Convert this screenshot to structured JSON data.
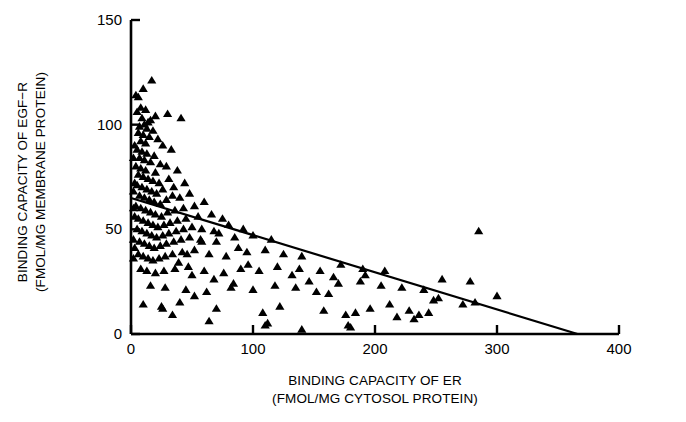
{
  "chart_data": {
    "type": "scatter",
    "title": "",
    "xlabel": "BINDING CAPACITY OF ER",
    "xlabel_line2": "(FMOL/MG CYTOSOL PROTEIN)",
    "ylabel": "BINDING CAPACITY OF EGF−R",
    "ylabel_line2": "(FMOL/MG MEMBRANE PROTEIN)",
    "xlim": [
      0,
      400
    ],
    "ylim": [
      0,
      150
    ],
    "xticks": [
      0,
      100,
      200,
      300,
      400
    ],
    "yticks": [
      0,
      50,
      100,
      150
    ],
    "xticklabels": [
      "0",
      "100",
      "200",
      "300",
      "400"
    ],
    "yticklabels": [
      "0",
      "50",
      "100",
      "150"
    ],
    "grid": false,
    "legend": null,
    "marker": "triangle-up",
    "marker_color": "#000000",
    "series": [
      {
        "name": "patients",
        "marker": "triangle-up",
        "points": [
          [
            4,
            114
          ],
          [
            6,
            113
          ],
          [
            10,
            117
          ],
          [
            17,
            121
          ],
          [
            8,
            108
          ],
          [
            12,
            107
          ],
          [
            5,
            106
          ],
          [
            20,
            104
          ],
          [
            9,
            103
          ],
          [
            14,
            101
          ],
          [
            16,
            102
          ],
          [
            7,
            99
          ],
          [
            11,
            100
          ],
          [
            13,
            98
          ],
          [
            18,
            97
          ],
          [
            30,
            105
          ],
          [
            41,
            103
          ],
          [
            6,
            96
          ],
          [
            10,
            95
          ],
          [
            15,
            94
          ],
          [
            22,
            93
          ],
          [
            8,
            92
          ],
          [
            12,
            91
          ],
          [
            26,
            90
          ],
          [
            5,
            88
          ],
          [
            9,
            87
          ],
          [
            13,
            86
          ],
          [
            19,
            85
          ],
          [
            33,
            88
          ],
          [
            7,
            84
          ],
          [
            11,
            83
          ],
          [
            16,
            82
          ],
          [
            24,
            81
          ],
          [
            4,
            80
          ],
          [
            8,
            79
          ],
          [
            12,
            78
          ],
          [
            20,
            77
          ],
          [
            29,
            80
          ],
          [
            38,
            78
          ],
          [
            6,
            76
          ],
          [
            10,
            75
          ],
          [
            14,
            74
          ],
          [
            18,
            73
          ],
          [
            23,
            72
          ],
          [
            31,
            74
          ],
          [
            5,
            71
          ],
          [
            9,
            70
          ],
          [
            13,
            69
          ],
          [
            17,
            68
          ],
          [
            21,
            67
          ],
          [
            26,
            69
          ],
          [
            35,
            70
          ],
          [
            44,
            72
          ],
          [
            7,
            66
          ],
          [
            11,
            65
          ],
          [
            15,
            64
          ],
          [
            19,
            63
          ],
          [
            24,
            62
          ],
          [
            29,
            64
          ],
          [
            34,
            66
          ],
          [
            40,
            65
          ],
          [
            48,
            67
          ],
          [
            4,
            61
          ],
          [
            8,
            60
          ],
          [
            12,
            59
          ],
          [
            16,
            58
          ],
          [
            20,
            57
          ],
          [
            25,
            56
          ],
          [
            30,
            58
          ],
          [
            36,
            59
          ],
          [
            43,
            60
          ],
          [
            52,
            61
          ],
          [
            60,
            63
          ],
          [
            6,
            55
          ],
          [
            10,
            54
          ],
          [
            14,
            53
          ],
          [
            18,
            52
          ],
          [
            22,
            51
          ],
          [
            27,
            52
          ],
          [
            32,
            53
          ],
          [
            38,
            54
          ],
          [
            45,
            55
          ],
          [
            55,
            56
          ],
          [
            66,
            57
          ],
          [
            75,
            55
          ],
          [
            5,
            50
          ],
          [
            9,
            49
          ],
          [
            13,
            48
          ],
          [
            17,
            47
          ],
          [
            21,
            46
          ],
          [
            26,
            47
          ],
          [
            31,
            48
          ],
          [
            37,
            49
          ],
          [
            43,
            50
          ],
          [
            50,
            51
          ],
          [
            58,
            50
          ],
          [
            68,
            49
          ],
          [
            80,
            52
          ],
          [
            92,
            50
          ],
          [
            7,
            44
          ],
          [
            11,
            43
          ],
          [
            15,
            42
          ],
          [
            19,
            41
          ],
          [
            24,
            42
          ],
          [
            29,
            43
          ],
          [
            35,
            44
          ],
          [
            41,
            45
          ],
          [
            48,
            46
          ],
          [
            57,
            45
          ],
          [
            70,
            44
          ],
          [
            85,
            46
          ],
          [
            100,
            47
          ],
          [
            115,
            45
          ],
          [
            6,
            38
          ],
          [
            10,
            37
          ],
          [
            14,
            36
          ],
          [
            18,
            35
          ],
          [
            23,
            36
          ],
          [
            28,
            37
          ],
          [
            34,
            38
          ],
          [
            42,
            39
          ],
          [
            52,
            40
          ],
          [
            64,
            38
          ],
          [
            78,
            37
          ],
          [
            95,
            39
          ],
          [
            110,
            40
          ],
          [
            125,
            38
          ],
          [
            140,
            37
          ],
          [
            8,
            31
          ],
          [
            13,
            30
          ],
          [
            20,
            29
          ],
          [
            27,
            30
          ],
          [
            36,
            31
          ],
          [
            47,
            32
          ],
          [
            60,
            30
          ],
          [
            76,
            29
          ],
          [
            90,
            31
          ],
          [
            105,
            30
          ],
          [
            120,
            32
          ],
          [
            138,
            31
          ],
          [
            155,
            30
          ],
          [
            172,
            33
          ],
          [
            190,
            31
          ],
          [
            16,
            23
          ],
          [
            28,
            22
          ],
          [
            45,
            21
          ],
          [
            62,
            20
          ],
          [
            82,
            22
          ],
          [
            100,
            21
          ],
          [
            118,
            23
          ],
          [
            135,
            22
          ],
          [
            152,
            20
          ],
          [
            170,
            24
          ],
          [
            188,
            25
          ],
          [
            205,
            23
          ],
          [
            222,
            22
          ],
          [
            240,
            21
          ],
          [
            255,
            26
          ],
          [
            278,
            25
          ],
          [
            300,
            18
          ],
          [
            10,
            14
          ],
          [
            25,
            13
          ],
          [
            40,
            15
          ],
          [
            70,
            12
          ],
          [
            108,
            10
          ],
          [
            122,
            13
          ],
          [
            140,
            2
          ],
          [
            158,
            11
          ],
          [
            176,
            9
          ],
          [
            180,
            3
          ],
          [
            196,
            12
          ],
          [
            212,
            14
          ],
          [
            228,
            11
          ],
          [
            236,
            9
          ],
          [
            248,
            16
          ],
          [
            252,
            17
          ],
          [
            272,
            14
          ],
          [
            282,
            15
          ],
          [
            52,
            18
          ],
          [
            64,
            6
          ],
          [
            34,
            9
          ],
          [
            26,
            12
          ],
          [
            110,
            4
          ],
          [
            112,
            5
          ],
          [
            178,
            4
          ],
          [
            184,
            10
          ],
          [
            218,
            8
          ],
          [
            232,
            7
          ],
          [
            244,
            10
          ],
          [
            285,
            49
          ],
          [
            2,
            68
          ],
          [
            3,
            72
          ],
          [
            2,
            60
          ],
          [
            3,
            56
          ],
          [
            2,
            84
          ],
          [
            3,
            90
          ],
          [
            2,
            45
          ],
          [
            3,
            41
          ],
          [
            2,
            36
          ],
          [
            146,
            25
          ],
          [
            162,
            19
          ],
          [
            192,
            28
          ],
          [
            208,
            30
          ],
          [
            166,
            27
          ],
          [
            132,
            28
          ],
          [
            96,
            33
          ],
          [
            88,
            41
          ],
          [
            72,
            48
          ],
          [
            58,
            44
          ],
          [
            46,
            38
          ],
          [
            39,
            34
          ],
          [
            50,
            28
          ],
          [
            68,
            26
          ],
          [
            84,
            24
          ]
        ]
      }
    ],
    "fit_line": {
      "name": "regression-line",
      "x_start": 0,
      "y_start": 65,
      "x_end": 366,
      "y_end": 0
    }
  },
  "caption": {
    "text": ""
  }
}
